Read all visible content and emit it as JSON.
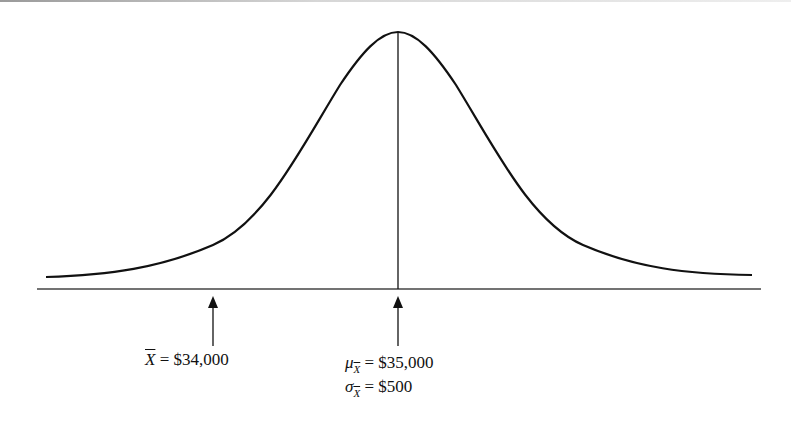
{
  "diagram": {
    "type": "normal-distribution-sampling",
    "curve": {
      "mean_x": 398,
      "peak_y": 32,
      "baseline_y": 289
    },
    "labels": {
      "sample_mean": {
        "symbol": "X",
        "text": " = $34,000"
      },
      "mu": {
        "symbol": "μ",
        "sub": "X",
        "text": " = $35,000"
      },
      "sigma": {
        "symbol": "σ",
        "sub": "X",
        "text": " = $500"
      }
    },
    "colors": {
      "line": "#111111",
      "background": "#ffffff"
    }
  }
}
